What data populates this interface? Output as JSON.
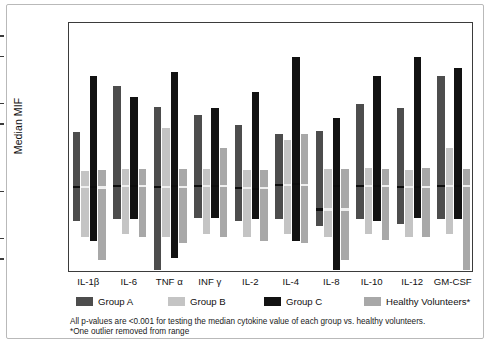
{
  "figure": {
    "y_axis_title": "Median MIF"
  },
  "legend": [
    {
      "label": "Group A",
      "color": "#4d4d4d"
    },
    {
      "label": "Group B",
      "color": "#c4c4c4"
    },
    {
      "label": "Group C",
      "color": "#121212"
    },
    {
      "label": "Healthy Volunteers*",
      "color": "#a8a8a8"
    }
  ],
  "footnote": {
    "line1": "All p-values are <0.001 for testing the median cytokine value of each group vs. healthy volunteers.",
    "line2": "*One outlier removed from range"
  },
  "chart_data": {
    "type": "bar",
    "title": "",
    "xlabel": "",
    "ylabel": "Median MIF",
    "yscale": "log",
    "ylim": [
      3.2,
      16000
    ],
    "ytick_labels": [
      "10,000",
      "5,000",
      "1,000",
      "500",
      "50",
      "10",
      "5"
    ],
    "ytick_values": [
      10000,
      5000,
      1000,
      500,
      50,
      10,
      5
    ],
    "grid": false,
    "legend_position": "below",
    "value_encoding": "floating range bars (low-high) with median line",
    "categories": [
      "IL-1β",
      "IL-6",
      "TNF α",
      "INF γ",
      "IL-2",
      "IL-4",
      "IL-8",
      "IL-10",
      "IL-12",
      "GM-CSF"
    ],
    "series": [
      {
        "name": "Group A",
        "color": "#4d4d4d",
        "low": [
          19,
          20,
          3.6,
          21,
          19,
          20,
          16,
          20,
          17,
          20
        ],
        "high": [
          390,
          1900,
          930,
          690,
          500,
          360,
          400,
          1000,
          880,
          2600
        ],
        "median": [
          60,
          62,
          60,
          62,
          58,
          64,
          28,
          62,
          60,
          63
        ]
      },
      {
        "name": "Group B",
        "color": "#c4c4c4",
        "low": [
          11,
          12,
          11,
          12,
          11,
          12,
          11,
          12,
          11,
          12
        ],
        "high": [
          105,
          110,
          440,
          110,
          108,
          300,
          110,
          115,
          108,
          230
        ]
      },
      {
        "name": "Group C",
        "color": "#121212",
        "low": [
          9.5,
          20,
          5.3,
          21,
          20,
          9.5,
          3.6,
          19,
          21,
          20
        ],
        "high": [
          2600,
          1300,
          3000,
          880,
          1500,
          5100,
          620,
          2600,
          5100,
          3400
        ],
        "median": [
          60,
          62,
          62,
          62,
          56,
          66,
          62,
          62,
          60,
          62
        ]
      },
      {
        "name": "Healthy Volunteers*",
        "color": "#a8a8a8",
        "low": [
          5.0,
          11,
          9.0,
          11,
          9.5,
          9.0,
          5.0,
          10,
          11,
          3.6
        ],
        "high": [
          108,
          110,
          112,
          230,
          108,
          360,
          110,
          112,
          114,
          110
        ],
        "median": [
          58,
          null,
          null,
          null,
          null,
          null,
          null,
          null,
          null,
          null
        ]
      }
    ]
  }
}
